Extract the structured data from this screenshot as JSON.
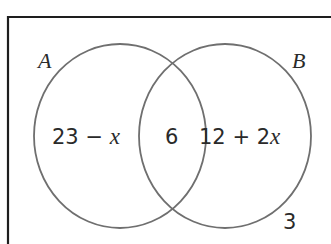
{
  "diagram": {
    "type": "venn",
    "colors": {
      "border": "#1e1e1e",
      "circle": "#6f6f6f",
      "text": "#2a2a2a"
    },
    "sets": [
      {
        "id": "A",
        "label": "A"
      },
      {
        "id": "B",
        "label": "B"
      }
    ],
    "regions": {
      "only_A": {
        "num": "23",
        "op": " − ",
        "var": "x"
      },
      "A_and_B": {
        "value": "6"
      },
      "only_B": {
        "num": "12 + 2",
        "var": "x"
      },
      "outside": {
        "value": "3"
      }
    }
  }
}
